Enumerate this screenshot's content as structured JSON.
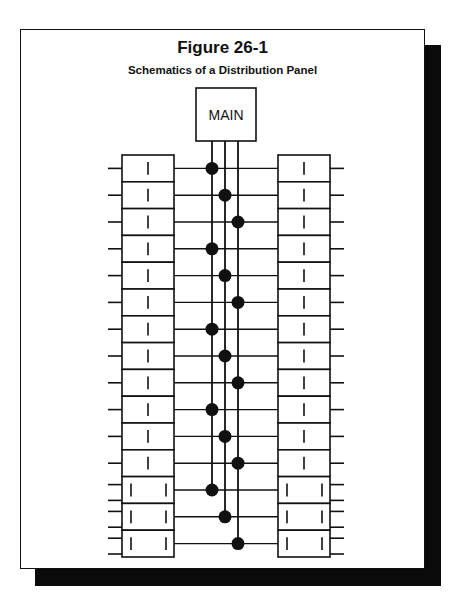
{
  "figure": {
    "title": "Figure 26-1",
    "subtitle": "Schematics of a Distribution Panel"
  },
  "main_breaker": {
    "label": "MAIN"
  },
  "panel": {
    "bus_bars": 3,
    "rows": [
      {
        "bus": 0,
        "poles": 1
      },
      {
        "bus": 1,
        "poles": 1
      },
      {
        "bus": 2,
        "poles": 1
      },
      {
        "bus": 0,
        "poles": 1
      },
      {
        "bus": 1,
        "poles": 1
      },
      {
        "bus": 2,
        "poles": 1
      },
      {
        "bus": 0,
        "poles": 1
      },
      {
        "bus": 1,
        "poles": 1
      },
      {
        "bus": 2,
        "poles": 1
      },
      {
        "bus": 0,
        "poles": 1
      },
      {
        "bus": 1,
        "poles": 1
      },
      {
        "bus": 2,
        "poles": 1
      },
      {
        "bus": 0,
        "poles": 2
      },
      {
        "bus": 1,
        "poles": 2
      },
      {
        "bus": 2,
        "poles": 2
      }
    ]
  },
  "colors": {
    "ink": "#111111",
    "shadow": "#0a0a0a",
    "paper": "#ffffff"
  }
}
